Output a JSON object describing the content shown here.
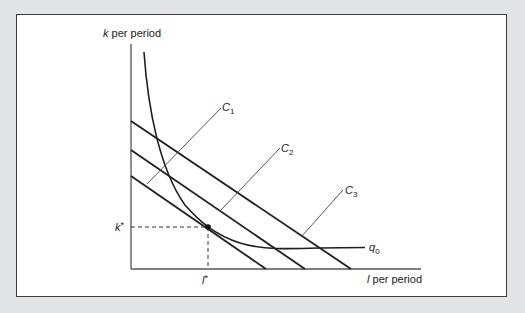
{
  "figure": {
    "type": "isoquant-isocost diagram",
    "y_axis_label": {
      "var": "k",
      "text": " per period"
    },
    "x_axis_label": {
      "var": "l",
      "text": " per period"
    },
    "k_star_label": {
      "var": "k",
      "sup": "*"
    },
    "l_star_label": {
      "var": "l",
      "sup": "*"
    },
    "isoquant_label": {
      "var": "q",
      "sub": "0"
    },
    "isocost_lines": [
      {
        "var": "C",
        "sub": "1"
      },
      {
        "var": "C",
        "sub": "2"
      },
      {
        "var": "C",
        "sub": "3"
      }
    ]
  },
  "colors": {
    "background": "#e3e4e6",
    "panel": "#ffffff",
    "line": "#1e1e1e",
    "axis": "#555555"
  }
}
